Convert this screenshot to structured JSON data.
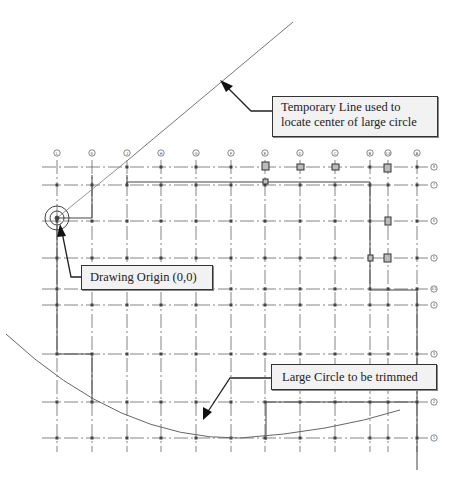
{
  "callouts": {
    "temporary_line": {
      "line1": "Temporary Line used to",
      "line2": "locate center of large circle"
    },
    "drawing_origin": {
      "text": "Drawing Origin (0,0)"
    },
    "large_circle": {
      "text": "Large Circle to be trimmed"
    }
  },
  "grid": {
    "columns": [
      {
        "label": "L",
        "x": 57
      },
      {
        "label": "K",
        "x": 92
      },
      {
        "label": "J",
        "x": 127
      },
      {
        "label": "H",
        "x": 161
      },
      {
        "label": "G",
        "x": 196
      },
      {
        "label": "F",
        "x": 231
      },
      {
        "label": "E",
        "x": 265
      },
      {
        "label": "D",
        "x": 300
      },
      {
        "label": "C",
        "x": 335
      },
      {
        "label": "B",
        "x": 370
      },
      {
        "label": "5.8",
        "x": 388
      },
      {
        "label": "A",
        "x": 417
      }
    ],
    "rows": [
      {
        "label": "8",
        "y": 167
      },
      {
        "label": "7",
        "y": 185
      },
      {
        "label": "6",
        "y": 221
      },
      {
        "label": "5",
        "y": 258
      },
      {
        "label": "4.5",
        "y": 289
      },
      {
        "label": "4",
        "y": 305
      },
      {
        "label": "3",
        "y": 354
      },
      {
        "label": "2",
        "y": 402
      },
      {
        "label": "1",
        "y": 438
      }
    ]
  },
  "colors": {
    "line": "#555555",
    "grid": "#666666",
    "box_bg": "#f2f2f2"
  },
  "caption": "Figure 5-26 Temporary line to locate center of circle"
}
